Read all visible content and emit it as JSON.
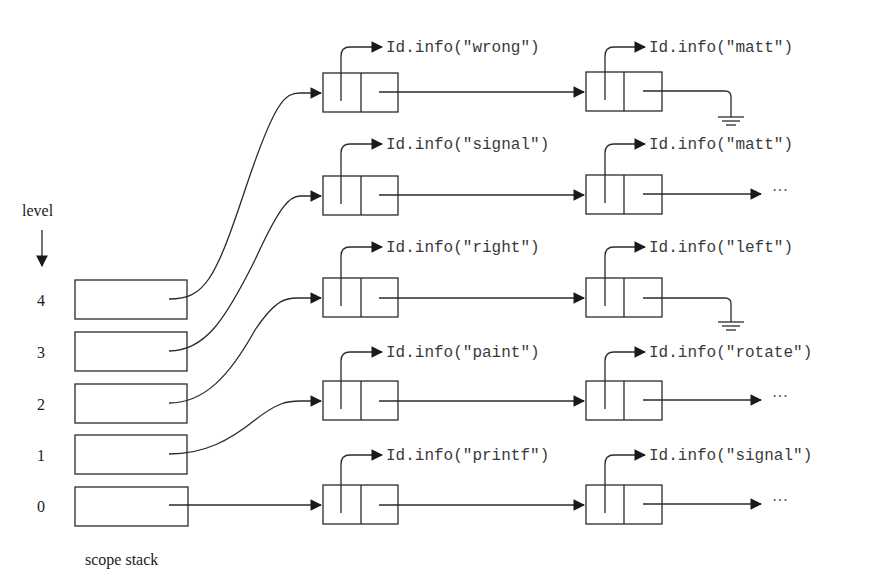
{
  "header_fragment": {
    "left": "518",
    "right": "p   a   s   t   r   e   i   s   e   m   e   n   t   i   s"
  },
  "level_label": "level",
  "stack_label": "scope stack",
  "ellipsis": "···",
  "scope_stack": [
    {
      "level": "4",
      "row": 0
    },
    {
      "level": "3",
      "row": 1
    },
    {
      "level": "2",
      "row": 2
    },
    {
      "level": "1",
      "row": 3
    },
    {
      "level": "0",
      "row": 4
    }
  ],
  "chains": [
    {
      "first": "Id.info(\"wrong\")",
      "second": "Id.info(\"right\")",
      "terminator": "null"
    },
    {
      "first": "Id.info(\"signal\")",
      "second": "Id.info(\"matt\")",
      "terminator": "more"
    },
    {
      "first": "Id.info(\"right\")",
      "second": "Id.info(\"left\")",
      "terminator": "null"
    },
    {
      "first": "Id.info(\"paint\")",
      "second": "Id.info(\"rotate\")",
      "terminator": "more"
    },
    {
      "first": "Id.info(\"printf\")",
      "second": "Id.info(\"signal\")",
      "terminator": "more"
    }
  ],
  "colors": {
    "line": "#2a2a2a",
    "text": "#3a3a3a",
    "background": "#ffffff"
  }
}
